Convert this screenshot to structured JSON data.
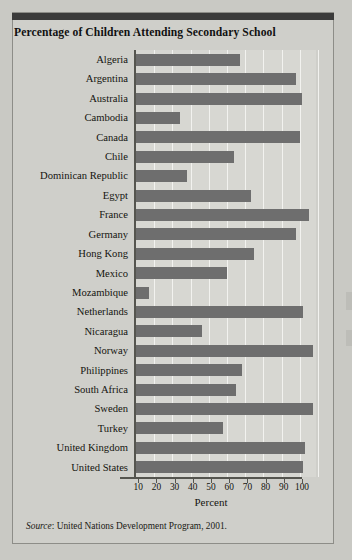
{
  "figure": {
    "title": "Percentage of Children Attending Secondary School",
    "source_prefix": "Source",
    "source_text": ": United Nations Development Program, 2001."
  },
  "axis": {
    "xlabel": "Percent",
    "ticks": [
      "10",
      "20",
      "30",
      "40",
      "50",
      "60",
      "70",
      "80",
      "90",
      "100"
    ]
  },
  "colors": {
    "bar": "#6e6e6e",
    "plot_background": "#d7d7d2",
    "gridline": "#f2f2ef",
    "page_background": "#c9c9c4",
    "axis": "#55554f",
    "title_text": "#111111"
  },
  "chart_data": {
    "type": "bar",
    "orientation": "horizontal",
    "title": "Percentage of Children Attending Secondary School",
    "xlabel": "Percent",
    "ylabel": "",
    "xlim": [
      0,
      100
    ],
    "xticks": [
      10,
      20,
      30,
      40,
      50,
      60,
      70,
      80,
      90,
      100
    ],
    "grid": true,
    "legend": false,
    "categories": [
      "Algeria",
      "Argentina",
      "Australia",
      "Cambodia",
      "Canada",
      "Chile",
      "Dominican Republic",
      "Egypt",
      "France",
      "Germany",
      "Hong Kong",
      "Mexico",
      "Mozambique",
      "Netherlands",
      "Nicaragua",
      "Norway",
      "Philippines",
      "South Africa",
      "Sweden",
      "Turkey",
      "United Kingdom",
      "United States"
    ],
    "values": [
      57,
      88,
      91,
      24,
      90,
      54,
      28,
      63,
      95,
      88,
      65,
      50,
      7,
      92,
      36,
      97,
      58,
      55,
      97,
      48,
      93,
      92
    ],
    "source": "Source: United Nations Development Program, 2001."
  }
}
